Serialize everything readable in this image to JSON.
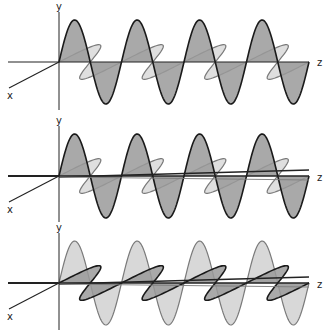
{
  "figure": {
    "colors": {
      "background": "#ffffff",
      "axis": "#222222",
      "fill_dark": "#9a9a9a",
      "fill_light": "#d4d4d4",
      "stroke_dark": "#1a1a1a",
      "stroke_light": "#7a7a7a"
    },
    "panels": [
      {
        "id": "panel-1",
        "axis_labels": {
          "y": "y",
          "x": "x",
          "z": "z"
        },
        "vertical_wave": {
          "emphasis": "dark",
          "cycles": 4
        },
        "oblique_wave": {
          "emphasis": "light",
          "cycles": 4
        },
        "z_axis_double": false
      },
      {
        "id": "panel-2",
        "axis_labels": {
          "y": "y",
          "x": "x",
          "z": "z"
        },
        "vertical_wave": {
          "emphasis": "dark",
          "cycles": 4
        },
        "oblique_wave": {
          "emphasis": "light",
          "cycles": 4
        },
        "z_axis_double": true
      },
      {
        "id": "panel-3",
        "axis_labels": {
          "y": "y",
          "x": "x",
          "z": "z"
        },
        "vertical_wave": {
          "emphasis": "light",
          "cycles": 4
        },
        "oblique_wave": {
          "emphasis": "dark",
          "cycles": 4
        },
        "z_axis_double": true
      }
    ]
  }
}
